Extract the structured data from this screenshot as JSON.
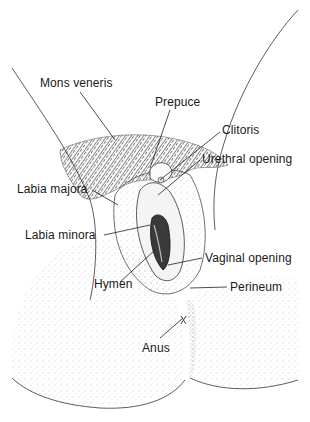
{
  "figure": {
    "type": "anatomical-line-drawing",
    "top_caption_truncated": "",
    "colors": {
      "ink": "#1a1a1a",
      "background": "#ffffff",
      "stipple": "#7a7a7a"
    }
  },
  "labels": [
    {
      "id": "mons-veneris",
      "text": "Mons veneris",
      "x": 40,
      "y": 76
    },
    {
      "id": "prepuce",
      "text": "Prepuce",
      "x": 155,
      "y": 95
    },
    {
      "id": "clitoris",
      "text": "Clitoris",
      "x": 222,
      "y": 123
    },
    {
      "id": "urethral-opening",
      "text": "Urethral opening",
      "x": 202,
      "y": 152
    },
    {
      "id": "labia-majora",
      "text": "Labia majora",
      "x": 17,
      "y": 182
    },
    {
      "id": "labia-minora",
      "text": "Labia minora",
      "x": 25,
      "y": 228
    },
    {
      "id": "vaginal-opening",
      "text": "Vaginal opening",
      "x": 205,
      "y": 251
    },
    {
      "id": "hymen",
      "text": "Hymen",
      "x": 94,
      "y": 277
    },
    {
      "id": "perineum",
      "text": "Perineum",
      "x": 230,
      "y": 280
    },
    {
      "id": "anus",
      "text": "Anus",
      "x": 142,
      "y": 341
    }
  ]
}
